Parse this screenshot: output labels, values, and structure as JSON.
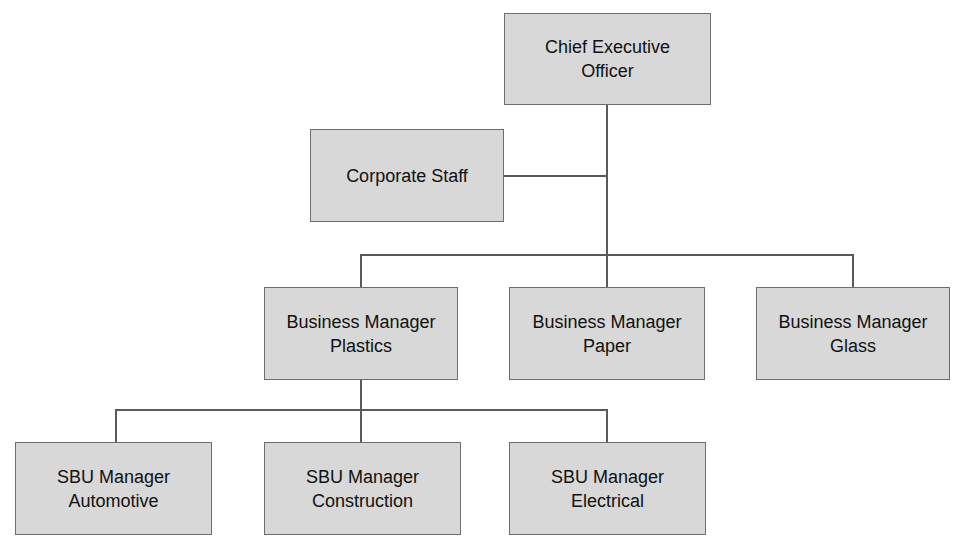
{
  "diagram": {
    "type": "org-chart",
    "nodes": {
      "ceo": {
        "line1": "Chief Executive",
        "line2": "Officer"
      },
      "staff": {
        "line1": "Corporate Staff",
        "line2": ""
      },
      "bm_plastics": {
        "line1": "Business Manager",
        "line2": "Plastics"
      },
      "bm_paper": {
        "line1": "Business Manager",
        "line2": "Paper"
      },
      "bm_glass": {
        "line1": "Business Manager",
        "line2": "Glass"
      },
      "sbu_automotive": {
        "line1": "SBU Manager",
        "line2": "Automotive"
      },
      "sbu_construction": {
        "line1": "SBU Manager",
        "line2": "Construction"
      },
      "sbu_electrical": {
        "line1": "SBU Manager",
        "line2": "Electrical"
      }
    },
    "edges": [
      [
        "ceo",
        "staff"
      ],
      [
        "ceo",
        "bm_plastics"
      ],
      [
        "ceo",
        "bm_paper"
      ],
      [
        "ceo",
        "bm_glass"
      ],
      [
        "bm_plastics",
        "sbu_automotive"
      ],
      [
        "bm_plastics",
        "sbu_construction"
      ],
      [
        "bm_plastics",
        "sbu_electrical"
      ]
    ],
    "colors": {
      "box_fill": "#d8d8d8",
      "box_border": "#6e6e6e",
      "line": "#5a5a5a"
    }
  }
}
